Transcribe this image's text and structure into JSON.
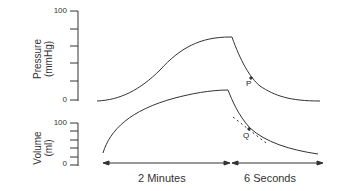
{
  "diagram": {
    "pressure_panel": {
      "ylabel_line1": "Pressure",
      "ylabel_line2": "(mmHg)",
      "tick_top": "100",
      "tick_bottom": "0",
      "point_label": "P"
    },
    "volume_panel": {
      "ylabel_line1": "Volume",
      "ylabel_line2": "(ml)",
      "tick_top": "100",
      "tick_bottom": "0",
      "point_label": "Q"
    },
    "time_axis": {
      "segment1_label": "2 Minutes",
      "segment2_label": "6 Seconds"
    },
    "colors": {
      "line": "#333333",
      "background": "#ffffff"
    }
  }
}
